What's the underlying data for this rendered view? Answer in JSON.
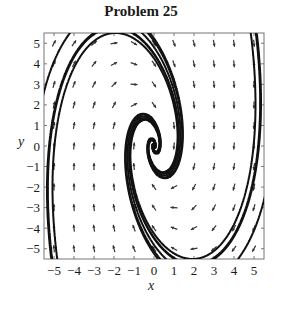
{
  "chart_data": {
    "type": "line",
    "subtype": "phase-portrait / direction field",
    "title": "Problem 25",
    "xlabel": "x",
    "ylabel": "y",
    "xlim": [
      -5.5,
      5.5
    ],
    "ylim": [
      -5.5,
      5.5
    ],
    "xticks": [
      -5,
      -4,
      -3,
      -2,
      -1,
      0,
      1,
      2,
      3,
      4,
      5
    ],
    "yticks": [
      5,
      4,
      3,
      2,
      1,
      0,
      -1,
      -2,
      -3,
      -4,
      -5
    ],
    "grid": false,
    "legend": null,
    "arrow_grid": {
      "x": [
        -5,
        -4,
        -3,
        -2,
        -1,
        0,
        1,
        2,
        3,
        4,
        5
      ],
      "y": [
        -5,
        -4,
        -3,
        -2,
        -1,
        0,
        1,
        2,
        3,
        4,
        5
      ]
    }
  },
  "title": "Problem 25",
  "axes": {
    "xlabel": "x",
    "ylabel": "y"
  }
}
